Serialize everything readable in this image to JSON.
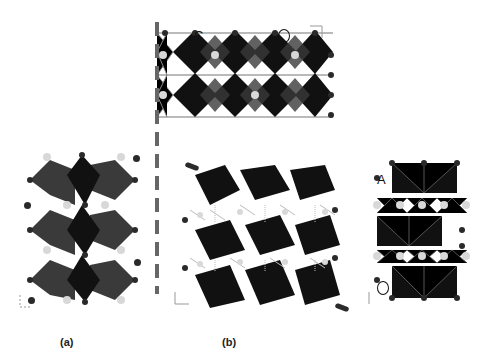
{
  "figure": {
    "panels": [
      {
        "id": "a",
        "caption": "(a)",
        "description": "octahedral framework, side view"
      },
      {
        "id": "b",
        "caption": "(b)",
        "description": "layered structure, perspective and projected views"
      }
    ],
    "annotations": {
      "top_left_letter": "C",
      "top_right_letter": "O",
      "right_top_letter": "A",
      "right_bottom_letter": "O"
    },
    "axes_labels": {
      "top_view": {
        "h": "x",
        "v": "y"
      },
      "panel_a": {
        "h": "x",
        "v": "z"
      },
      "panel_b_perspective": {
        "h": "x",
        "v": "z"
      },
      "panel_b_side": {
        "h": "",
        "v": "z"
      }
    },
    "colors": {
      "octahedron_dark": "#111111",
      "octahedron_mid": "#3a3a3a",
      "atom_dark": "#2a2a2a",
      "atom_light": "#d8d8d8",
      "bond": "#777777",
      "divider": "#666666"
    }
  }
}
